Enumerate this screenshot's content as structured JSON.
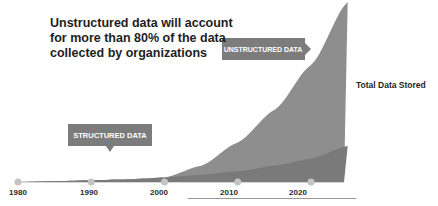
{
  "chart_data": {
    "type": "area",
    "title": "Unstructured data will account for more than 80% of the data collected by organizations",
    "xlabel": "",
    "ylabel": "Total Data Stored",
    "x": [
      1980,
      1985,
      1990,
      1995,
      2000,
      2005,
      2010,
      2015,
      2020,
      2025
    ],
    "xticks": [
      "1980",
      "1990",
      "2000",
      "2010",
      "2020"
    ],
    "xlim": [
      1980,
      2027
    ],
    "ylim": [
      0,
      100
    ],
    "grid": false,
    "series": [
      {
        "name": "STRUCTURED DATA",
        "values": [
          0,
          0.5,
          1,
          1.5,
          2.5,
          4,
          6,
          9,
          13,
          20
        ]
      },
      {
        "name": "UNSTRUCTURED DATA",
        "values": [
          0,
          0.2,
          0.5,
          1,
          2,
          9,
          22,
          40,
          65,
          100
        ]
      }
    ],
    "annotations": [
      {
        "text": "UNSTRUCTURED DATA",
        "series": "UNSTRUCTURED DATA"
      },
      {
        "text": "STRUCTURED DATA",
        "series": "STRUCTURED DATA"
      }
    ],
    "colors": {
      "structured": "#7a7a7a",
      "unstructured": "#8e8e8e",
      "callout": "#7c7c7c",
      "marker": "#c4c4c4"
    }
  },
  "headline": "Unstructured data will account for more than 80% of the data collected by organizations",
  "side_label": "Total Data Stored"
}
